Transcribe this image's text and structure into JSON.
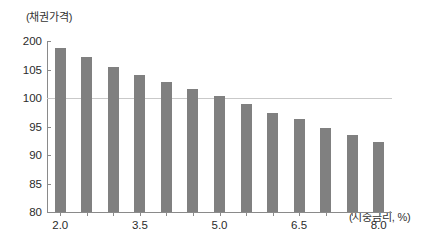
{
  "chart_data": {
    "type": "bar",
    "title": "",
    "xlabel": "(시중금리, %)",
    "ylabel": "(채권가격)",
    "categories": [
      "2.0",
      "2.5",
      "3.0",
      "3.5",
      "4.0",
      "4.5",
      "5.0",
      "5.5",
      "6.0",
      "6.5",
      "7.0",
      "7.5",
      "8.0"
    ],
    "values": [
      108.8,
      107.2,
      105.5,
      104.1,
      102.8,
      101.5,
      100.3,
      99.0,
      97.4,
      96.3,
      94.8,
      93.5,
      92.3
    ],
    "x_tick_labels": [
      "2.0",
      "3.5",
      "5.0",
      "6.5",
      "8.0"
    ],
    "y_tick_labels": [
      "200",
      "105",
      "100",
      "95",
      "90",
      "85",
      "80"
    ],
    "y_tick_values": [
      110,
      105,
      100,
      95,
      90,
      85,
      80
    ],
    "ylim": [
      80,
      110
    ],
    "grid": "single horizontal reference line at 100",
    "reference_line": 100,
    "legend": "none",
    "bar_color": "#808080",
    "axis_color": "#8a8a8a",
    "gridline_color": "#c9c9c9",
    "series_name": "채권가격"
  }
}
